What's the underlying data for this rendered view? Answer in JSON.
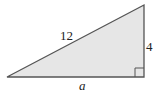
{
  "diagram": {
    "type": "right-triangle",
    "labels": {
      "hypotenuse": "12",
      "vertical_leg": "4",
      "horizontal_leg": "a"
    },
    "has_right_angle_marker": true,
    "colors": {
      "fill": "#e6e6e6",
      "stroke": "#555555",
      "text": "#222222"
    }
  }
}
